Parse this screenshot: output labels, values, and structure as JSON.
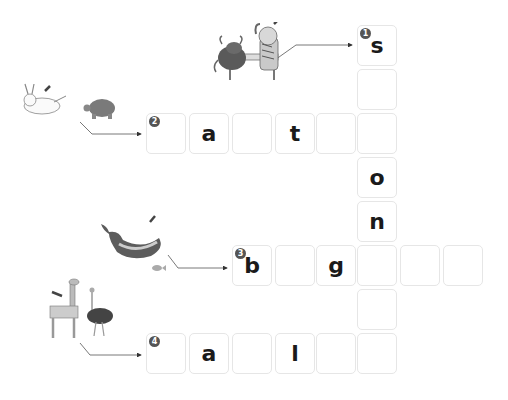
{
  "puzzle": {
    "cells": [
      {
        "id": "c1-1",
        "x": 357,
        "y": 25,
        "letter": "s",
        "num": "1"
      },
      {
        "id": "c1-2",
        "x": 357,
        "y": 69,
        "letter": ""
      },
      {
        "id": "c1-3",
        "x": 357,
        "y": 113,
        "letter": ""
      },
      {
        "id": "c1-4",
        "x": 357,
        "y": 157,
        "letter": "o"
      },
      {
        "id": "c1-5",
        "x": 357,
        "y": 201,
        "letter": "n"
      },
      {
        "id": "c1-6",
        "x": 357,
        "y": 245,
        "letter": ""
      },
      {
        "id": "c1-7",
        "x": 357,
        "y": 289,
        "letter": ""
      },
      {
        "id": "c1-8",
        "x": 357,
        "y": 333,
        "letter": ""
      },
      {
        "id": "c2-1",
        "x": 146,
        "y": 113,
        "letter": "",
        "num": "2"
      },
      {
        "id": "c2-2",
        "x": 189,
        "y": 113,
        "letter": "a"
      },
      {
        "id": "c2-3",
        "x": 232,
        "y": 113,
        "letter": ""
      },
      {
        "id": "c2-4",
        "x": 275,
        "y": 113,
        "letter": "t"
      },
      {
        "id": "c2-5",
        "x": 316,
        "y": 113,
        "letter": ""
      },
      {
        "id": "c3-1",
        "x": 232,
        "y": 245,
        "letter": "b",
        "num": "3"
      },
      {
        "id": "c3-2",
        "x": 275,
        "y": 245,
        "letter": ""
      },
      {
        "id": "c3-3",
        "x": 316,
        "y": 245,
        "letter": "g"
      },
      {
        "id": "c3-5",
        "x": 400,
        "y": 245,
        "letter": ""
      },
      {
        "id": "c3-6",
        "x": 443,
        "y": 245,
        "letter": ""
      },
      {
        "id": "c4-1",
        "x": 146,
        "y": 333,
        "letter": "",
        "num": "4"
      },
      {
        "id": "c4-2",
        "x": 189,
        "y": 333,
        "letter": "a"
      },
      {
        "id": "c4-3",
        "x": 232,
        "y": 333,
        "letter": ""
      },
      {
        "id": "c4-4",
        "x": 275,
        "y": 333,
        "letter": "l"
      },
      {
        "id": "c4-5",
        "x": 316,
        "y": 333,
        "letter": ""
      }
    ]
  },
  "clues": [
    {
      "num": "1",
      "picture": "ox-and-tiger-arm-wrestling",
      "target": "tiger"
    },
    {
      "num": "2",
      "picture": "rabbit-and-turtle-race",
      "target": "rabbit"
    },
    {
      "num": "3",
      "picture": "whale-and-small-fish",
      "target": "whale"
    },
    {
      "num": "4",
      "picture": "giraffe-and-ostrich",
      "target": "giraffe"
    }
  ],
  "colors": {
    "cell_border": "#e6e6e6",
    "letter": "#1a1a1a",
    "badge": "#555555",
    "arrow_line": "#555555"
  }
}
